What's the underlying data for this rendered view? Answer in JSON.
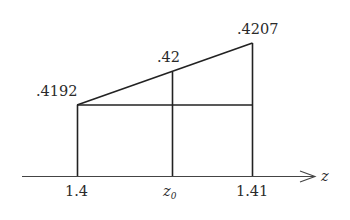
{
  "diagram": {
    "type": "linear-interpolation",
    "axis": {
      "label": "z",
      "ticks": [
        {
          "label": "1.4",
          "x": 77
        },
        {
          "label_main": "z",
          "label_sub": "0",
          "x": 172
        },
        {
          "label": "1.41",
          "x": 252
        }
      ]
    },
    "points": [
      {
        "label": ".4192",
        "x": 77,
        "y": 105
      },
      {
        "label": ".42",
        "x": 172,
        "y": 72
      },
      {
        "label": ".4207",
        "x": 252,
        "y": 43
      }
    ],
    "colors": {
      "line": "#222222",
      "text": "#2a2a2a",
      "background": "#ffffff"
    }
  }
}
